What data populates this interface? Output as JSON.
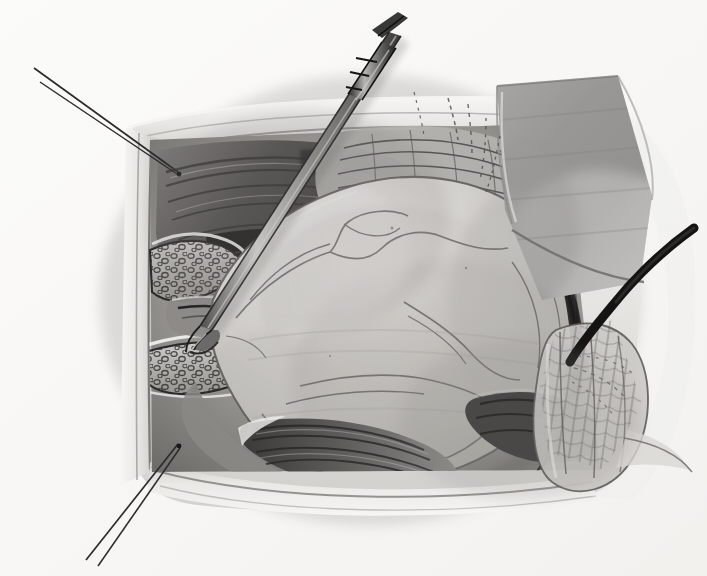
{
  "figure": {
    "medium": "graphite pencil drawing",
    "orientation": "landscape",
    "width": 707,
    "height": 576,
    "caption": "",
    "label": "",
    "visible_text": []
  },
  "palette": {
    "paper": "#f8f8f7",
    "paper_shadow": "#eceae7",
    "drape_light": "#f2f1ef",
    "drape_mid": "#dcdbd8",
    "drape_shadow": "#b9b8b4",
    "tissue_pale": "#d9d7d3",
    "tissue_mid": "#b4b2ae",
    "tissue_deep": "#8e8c89",
    "muscle_dark": "#575654",
    "ink_black": "#1b1b1b",
    "ink_mid": "#4a4a49",
    "line_soft": "#6d6c6a",
    "mass_highlight": "#e4e2de",
    "mass_body": "#c9c7c3",
    "mass_shade": "#a9a7a3",
    "retractor_blade": "#a8a7a4",
    "retractor_blade_dark": "#8b8a87",
    "instrument_steel": "#9e9d9a",
    "instrument_dark": "#333332"
  },
  "scene": {
    "name": "open surgical exposure with retracted wound edges",
    "elements": [
      {
        "id": "sterile-drape-field",
        "label": "Sterile drape framing the operative window",
        "note": "Pale folded cloth forming a square aperture around the wound"
      },
      {
        "id": "wound-edge-left",
        "label": "Retracted left wound edge with skin fold",
        "note": "Vertical drape/skin fold along left margin of the window"
      },
      {
        "id": "subcutaneous-fat-upper",
        "label": "Cut edge of subcutaneous adipose tissue (upper)",
        "note": "Lobulated stippled fat band on the left, upper"
      },
      {
        "id": "subcutaneous-fat-lower",
        "label": "Cut edge of subcutaneous adipose tissue (lower)",
        "note": "Lobulated stippled fat band on the left, lower"
      },
      {
        "id": "muscle-layer-upper-left",
        "label": "Dark swirling muscle and fascial layer, upper left",
        "note": "Heavily shaded striated fibers"
      },
      {
        "id": "fascial-striations-upper-right",
        "label": "Striated fascia / aponeurosis, upper right",
        "note": "Parallel fan of fine fibre lines"
      },
      {
        "id": "central-mass",
        "label": "Large pale ovoid mass delivered into the wound",
        "note": "Smooth lobulated surface with faint surface vessels"
      },
      {
        "id": "surface-vessels",
        "label": "Surface vessels traced over the mass",
        "note": "Thin meandering outline contours"
      },
      {
        "id": "muscle-band-inferior",
        "label": "Inferior muscle bands beneath the mass",
        "note": "Dark parallel fibre bundles across the lower field"
      },
      {
        "id": "mesh-flap-right",
        "label": "Mesh / netting over the right tissue flap",
        "note": "Cross-hatched grid pattern"
      },
      {
        "id": "retractor-blade",
        "label": "Retractor blade / gauze pad, upper right",
        "note": "Large soft-grey rounded rectangle holding tissue aside"
      },
      {
        "id": "dissecting-instrument",
        "label": "Long slender dissecting instrument",
        "note": "Enters from top, tip engaging the left margin of the mass"
      },
      {
        "id": "suture-upper-left",
        "label": "Stay suture / tie, upper left corner",
        "note": "Two fine parallel lines leaving the drape corner"
      },
      {
        "id": "suture-lower-left",
        "label": "Stay suture / tie, lower left corner",
        "note": "Two fine parallel lines leaving the drape corner"
      },
      {
        "id": "drape-edge-right",
        "label": "Heavy dark drape edge, right",
        "note": "Bold black curved stroke sweeping to the right border"
      },
      {
        "id": "hair-lines-upper-right",
        "label": "Fine hatched thread marks above right flap",
        "note": "Short stippled strokes"
      }
    ]
  }
}
